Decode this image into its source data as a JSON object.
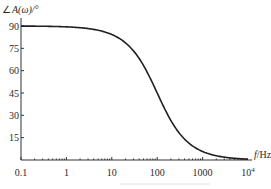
{
  "chart_data": {
    "type": "line",
    "title": "",
    "xlabel": "f/Hz",
    "ylabel": "∠A(ω)/°",
    "xscale": "log",
    "xlim": [
      0.1,
      10000
    ],
    "ylim": [
      0,
      90
    ],
    "grid": false,
    "x_ticks": [
      "0.1",
      "1",
      "10",
      "100",
      "1000",
      "10^4"
    ],
    "y_ticks": [
      "15",
      "30",
      "45",
      "60",
      "75",
      "90"
    ],
    "series": [
      {
        "name": "phase",
        "x": [
          0.1,
          1,
          5,
          10,
          20,
          50,
          100,
          200,
          500,
          1000,
          2000,
          5000,
          10000
        ],
        "values": [
          90,
          89.4,
          87.1,
          84.3,
          78.7,
          63.4,
          45,
          26.6,
          11.3,
          5.7,
          2.9,
          1.1,
          0.6
        ]
      }
    ]
  },
  "labels": {
    "ylabel_angle": "∠",
    "ylabel_main": "A(ω)/°",
    "xlabel_f": "f",
    "xlabel_unit": "/Hz",
    "x_ticks": [
      "0.1",
      "1",
      "10",
      "100",
      "1000",
      "10"
    ],
    "x_tick_last_exp": "4",
    "y_ticks": [
      "90",
      "75",
      "60",
      "45",
      "30",
      "15"
    ]
  }
}
